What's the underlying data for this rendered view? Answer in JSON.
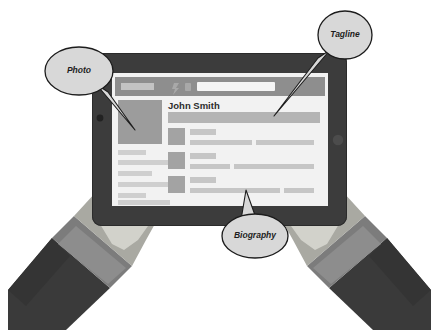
{
  "scene": {
    "title": "Hands holding tablet showing profile page wireframe",
    "background_color": "#ffffff"
  },
  "palette": {
    "bezel_dark": "#3c3c3c",
    "bezel_edge": "#2b2b2b",
    "screen_bg": "#f2f2f2",
    "header_bar": "#8e8e8e",
    "placeholder_dark": "#9a9a9a",
    "placeholder_mid": "#b4b4b4",
    "placeholder_light": "#cfcfcf",
    "photo_block": "#9c9c9c",
    "hand_light": "#d2d2cb",
    "hand_mid": "#a9a9a2",
    "sleeve_dark": "#3a3a3a",
    "cuff_gray": "#7c7c7c",
    "bubble_fill": "#d8d8d8",
    "bubble_stroke": "#1c1c1c",
    "text_dark": "#1c1c1c",
    "search_field": "#f5f5f5"
  },
  "tablet": {
    "camera_dot": "camera-dot",
    "home_button": "home-button"
  },
  "screen": {
    "header": {
      "logo_label": "logo-placeholder",
      "icons": [
        "header-icon-1",
        "header-icon-2"
      ],
      "search_placeholder": ""
    },
    "profile": {
      "name": "John Smith",
      "photo_label": "profile-photo-placeholder",
      "tagline_label": "tagline-bar-placeholder"
    },
    "sidebar_lines": [
      {
        "width": 28,
        "tone": "mid"
      },
      {
        "width": 52,
        "tone": "mid"
      },
      {
        "width": 34,
        "tone": "mid"
      },
      {
        "width": 52,
        "tone": "mid"
      }
    ],
    "biography_rows": [
      {
        "thumb": "row-thumb-1",
        "heading_width": 26,
        "lines": [
          {
            "x": 0,
            "width": 62
          },
          {
            "x": 66,
            "width": 58
          }
        ]
      },
      {
        "thumb": "row-thumb-2",
        "heading_width": 26,
        "lines": [
          {
            "x": 0,
            "width": 40
          },
          {
            "x": 44,
            "width": 80
          }
        ]
      },
      {
        "thumb": "row-thumb-3",
        "heading_width": 26,
        "lines": [
          {
            "x": 0,
            "width": 90
          },
          {
            "x": 94,
            "width": 30
          }
        ]
      }
    ]
  },
  "callouts": {
    "photo": {
      "label": "Photo",
      "cx": 79,
      "cy": 71
    },
    "tagline": {
      "label": "Tagline",
      "cx": 345,
      "cy": 35
    },
    "biography": {
      "label": "Biography",
      "cx": 255,
      "cy": 236
    }
  }
}
